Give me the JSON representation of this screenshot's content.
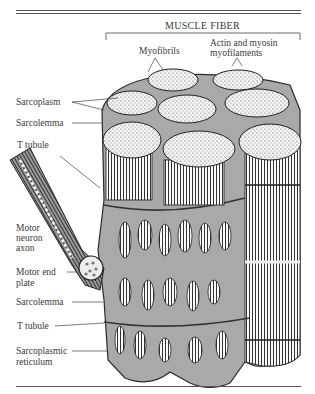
{
  "figure": {
    "title": "MUSCLE FIBER",
    "labels": {
      "myofibrils": "Myofibrils",
      "filaments_line1": "Actin and myosin",
      "filaments_line2": "myofilaments",
      "sarcoplasm": "Sarcoplasm",
      "sarcolemma_top": "Sarcolemma",
      "t_tubule_top": "T tubule",
      "motor_neuron_1": "Motor",
      "motor_neuron_2": "neuron",
      "motor_neuron_3": "axon",
      "motor_end_1": "Motor end",
      "motor_end_2": "plate",
      "sarcolemma_bottom": "Sarcolemma",
      "t_tubule_bottom": "T tubule",
      "sr_1": "Sarcoplasmic",
      "sr_2": "reticulum"
    },
    "colors": {
      "ink": "#2a2a2a",
      "sarcoplasm_fill": "#a9a9a9",
      "myofibril_fill": "#f2f2f2",
      "rule": "#555555"
    }
  }
}
